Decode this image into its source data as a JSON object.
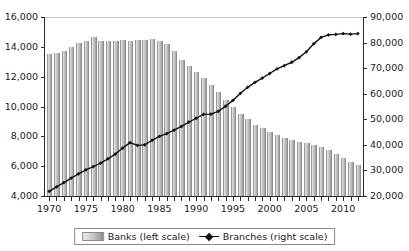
{
  "chart_data": {
    "type": "bar",
    "title": "",
    "subtitle": "",
    "xlabel": "",
    "ylabel": "",
    "grid": false,
    "legend_position": "bottom-center",
    "x": [
      1970,
      1971,
      1972,
      1973,
      1974,
      1975,
      1976,
      1977,
      1978,
      1979,
      1980,
      1981,
      1982,
      1983,
      1984,
      1985,
      1986,
      1987,
      1988,
      1989,
      1990,
      1991,
      1992,
      1993,
      1994,
      1995,
      1996,
      1997,
      1998,
      1999,
      2000,
      2001,
      2002,
      2003,
      2004,
      2005,
      2006,
      2007,
      2008,
      2009,
      2010,
      2011,
      2012
    ],
    "xtick_labels": [
      "1970",
      "1975",
      "1980",
      "1985",
      "1990",
      "1995",
      "2000",
      "2005",
      "2010"
    ],
    "xtick_label_values": [
      1970,
      1975,
      1980,
      1985,
      1990,
      1995,
      2000,
      2005,
      2010
    ],
    "xlim": [
      1969.3,
      2012.7
    ],
    "left_axis": {
      "label": "Banks (left scale)",
      "ylim": [
        4000,
        16000
      ],
      "ytick_values": [
        4000,
        6000,
        8000,
        10000,
        12000,
        14000,
        16000
      ],
      "ytick_labels": [
        "4,000",
        "6,000",
        "8,000",
        "10,000",
        "12,000",
        "14,000",
        "16,000"
      ]
    },
    "right_axis": {
      "label": "Branches (right scale)",
      "ylim": [
        20000,
        90000
      ],
      "ytick_values": [
        20000,
        30000,
        40000,
        50000,
        60000,
        70000,
        80000,
        90000
      ],
      "ytick_labels": [
        "20,000",
        "30,000",
        "40,000",
        "50,000",
        "60,000",
        "70,000",
        "80,000",
        "90,000"
      ]
    },
    "series": [
      {
        "name": "Banks (left scale)",
        "axis": "left",
        "type": "bar",
        "color": "#a8a8a8",
        "values": [
          13511,
          13612,
          13723,
          13976,
          14230,
          14384,
          14671,
          14411,
          14391,
          14364,
          14435,
          14414,
          14451,
          14469,
          14496,
          14417,
          14210,
          13703,
          13123,
          12709,
          12343,
          11921,
          11463,
          10959,
          10452,
          9942,
          9528,
          9143,
          8774,
          8580,
          8315,
          8080,
          7888,
          7770,
          7631,
          7526,
          7402,
          7284,
          7086,
          6840,
          6529,
          6291,
          6096
        ]
      },
      {
        "name": "Branches (right scale)",
        "axis": "right",
        "type": "line",
        "color": "#111111",
        "marker": "diamond",
        "values": [
          21839,
          23565,
          25243,
          26997,
          28654,
          30241,
          31504,
          32828,
          34550,
          36394,
          38738,
          40867,
          39784,
          40000,
          41799,
          43293,
          44400,
          45800,
          47200,
          48900,
          50406,
          51939,
          52000,
          53100,
          55100,
          57400,
          60100,
          62500,
          64400,
          66100,
          67900,
          69700,
          71000,
          72300,
          74100,
          76400,
          79500,
          82000,
          83000,
          83200,
          83500,
          83300,
          83500
        ]
      }
    ]
  },
  "legend": {
    "items": [
      {
        "label": "Banks (left scale)",
        "swatch": "bar-swatch"
      },
      {
        "label": "Branches (right scale)",
        "swatch": "line-marker-swatch"
      }
    ]
  }
}
